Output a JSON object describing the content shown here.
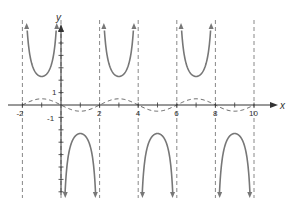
{
  "chart_data": {
    "type": "line",
    "title": "",
    "xlabel": "x",
    "ylabel": "y",
    "xlim": [
      -2.3,
      11.5
    ],
    "ylim": [
      -4.5,
      6.2
    ],
    "grid": false,
    "x_ticks": [
      -2,
      -1,
      0,
      1,
      2,
      3,
      4,
      5,
      6,
      7,
      8,
      9,
      10
    ],
    "x_tick_labels": [
      "-2",
      "2",
      "4",
      "6",
      "8",
      "10"
    ],
    "x_tick_label_values": [
      -2,
      2,
      4,
      6,
      8,
      10
    ],
    "y_ticks": [
      -7,
      -6,
      -5,
      -4,
      -3,
      -2,
      -1,
      1,
      2,
      3,
      4,
      5,
      6
    ],
    "y_tick_labels": [
      "1",
      "-1"
    ],
    "y_tick_label_values": [
      1,
      -1
    ],
    "asymptotes_x": [
      -2,
      0,
      2,
      4,
      6,
      8,
      10
    ],
    "series": [
      {
        "name": "cosecant curve",
        "style": "solid",
        "color": "#777777",
        "description": "y = csc-type branches with period 4; local minima at y≈2.3 opening upward and maxima at y≈-2.3 opening downward",
        "branches": [
          {
            "interval": [
              -2,
              0
            ],
            "direction": "up",
            "vertex": [
              -1,
              2.3
            ]
          },
          {
            "interval": [
              0,
              2
            ],
            "direction": "down",
            "vertex": [
              1,
              -2.3
            ]
          },
          {
            "interval": [
              2,
              4
            ],
            "direction": "up",
            "vertex": [
              3,
              2.3
            ]
          },
          {
            "interval": [
              4,
              6
            ],
            "direction": "down",
            "vertex": [
              5,
              -2.3
            ]
          },
          {
            "interval": [
              6,
              8
            ],
            "direction": "up",
            "vertex": [
              7,
              2.3
            ]
          },
          {
            "interval": [
              8,
              10
            ],
            "direction": "down",
            "vertex": [
              9,
              -2.3
            ]
          }
        ]
      },
      {
        "name": "sine reference curve",
        "style": "dashed",
        "color": "#555555",
        "description": "y = -0.5 sin(pi x / 2)",
        "amplitude": 0.5,
        "period": 4,
        "x_range": [
          -2,
          10
        ]
      }
    ]
  },
  "labels": {
    "x_axis": "x",
    "y_axis": "y",
    "tick_x": [
      "-2",
      "2",
      "4",
      "6",
      "8",
      "10"
    ],
    "tick_y_pos": "1",
    "tick_y_neg": "-1"
  },
  "colors": {
    "curve": "#777777",
    "axis": "#333333",
    "asymptote": "#888888",
    "dashed_curve": "#555555"
  }
}
